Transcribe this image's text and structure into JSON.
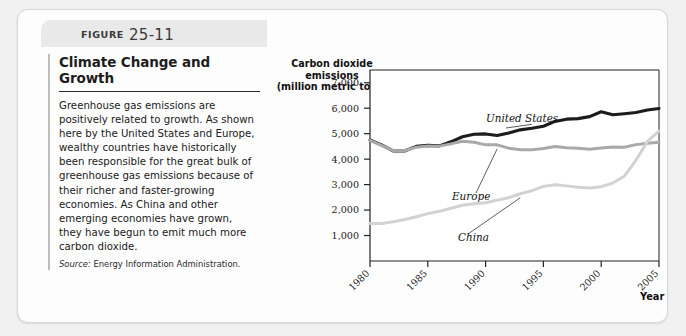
{
  "figure": {
    "label_word": "FIGURE",
    "number": "25-11"
  },
  "article": {
    "title": "Climate Change and Growth",
    "body": "Greenhouse gas emissions are positively related to growth. As shown here by the United States and Europe, wealthy countries have historically been responsible for the great bulk of greenhouse gas emissions because of their richer and faster-growing economies. As China and other emerging economies have grown, they have begun to emit much more carbon dioxide.",
    "source_word": "Source:",
    "source_text": " Energy Information Administration."
  },
  "chart_data": {
    "type": "line",
    "title": "",
    "ylabel": "Carbon dioxide\nemissions\n(million metric tons)",
    "ylabel_lines": [
      "Carbon dioxide",
      "emissions",
      "(million metric tons)"
    ],
    "xlabel": "Year",
    "ylim": [
      0,
      7500
    ],
    "xlim": [
      1980,
      2005
    ],
    "yticks": [
      1000,
      2000,
      3000,
      4000,
      5000,
      6000,
      7000
    ],
    "ytick_labels": [
      "1,000",
      "2,000",
      "3,000",
      "4,000",
      "5,000",
      "6,000",
      "7,000"
    ],
    "xticks": [
      1980,
      1985,
      1990,
      1995,
      2000,
      2005
    ],
    "xtick_labels": [
      "1980",
      "1985",
      "1990",
      "1995",
      "2000",
      "2005"
    ],
    "grid": false,
    "legend": "inline-annotations",
    "x": [
      1980,
      1981,
      1982,
      1983,
      1984,
      1985,
      1986,
      1987,
      1988,
      1989,
      1990,
      1991,
      1992,
      1993,
      1994,
      1995,
      1996,
      1997,
      1998,
      1999,
      2000,
      2001,
      2002,
      2003,
      2004,
      2005
    ],
    "series": [
      {
        "name": "United States",
        "color": "#1c1c1c",
        "width": 3.1,
        "values": [
          4750,
          4560,
          4320,
          4320,
          4500,
          4540,
          4520,
          4680,
          4880,
          4980,
          4990,
          4930,
          5030,
          5150,
          5210,
          5290,
          5480,
          5570,
          5590,
          5670,
          5860,
          5740,
          5780,
          5830,
          5930,
          5990
        ]
      },
      {
        "name": "Europe",
        "color": "#a9a9a9",
        "width": 3.0,
        "values": [
          4740,
          4540,
          4330,
          4330,
          4470,
          4520,
          4510,
          4600,
          4700,
          4660,
          4560,
          4560,
          4430,
          4370,
          4370,
          4420,
          4500,
          4450,
          4430,
          4390,
          4440,
          4480,
          4470,
          4570,
          4620,
          4660
        ]
      },
      {
        "name": "China",
        "color": "#d2d2d2",
        "width": 3.0,
        "values": [
          1470,
          1470,
          1540,
          1630,
          1740,
          1860,
          1950,
          2070,
          2190,
          2250,
          2290,
          2390,
          2480,
          2640,
          2760,
          2930,
          2990,
          2950,
          2900,
          2870,
          2920,
          3060,
          3330,
          3950,
          4700,
          5100
        ]
      }
    ],
    "annotations": [
      {
        "text": "United States",
        "series": "United States"
      },
      {
        "text": "Europe",
        "series": "Europe"
      },
      {
        "text": "China",
        "series": "China"
      }
    ]
  }
}
